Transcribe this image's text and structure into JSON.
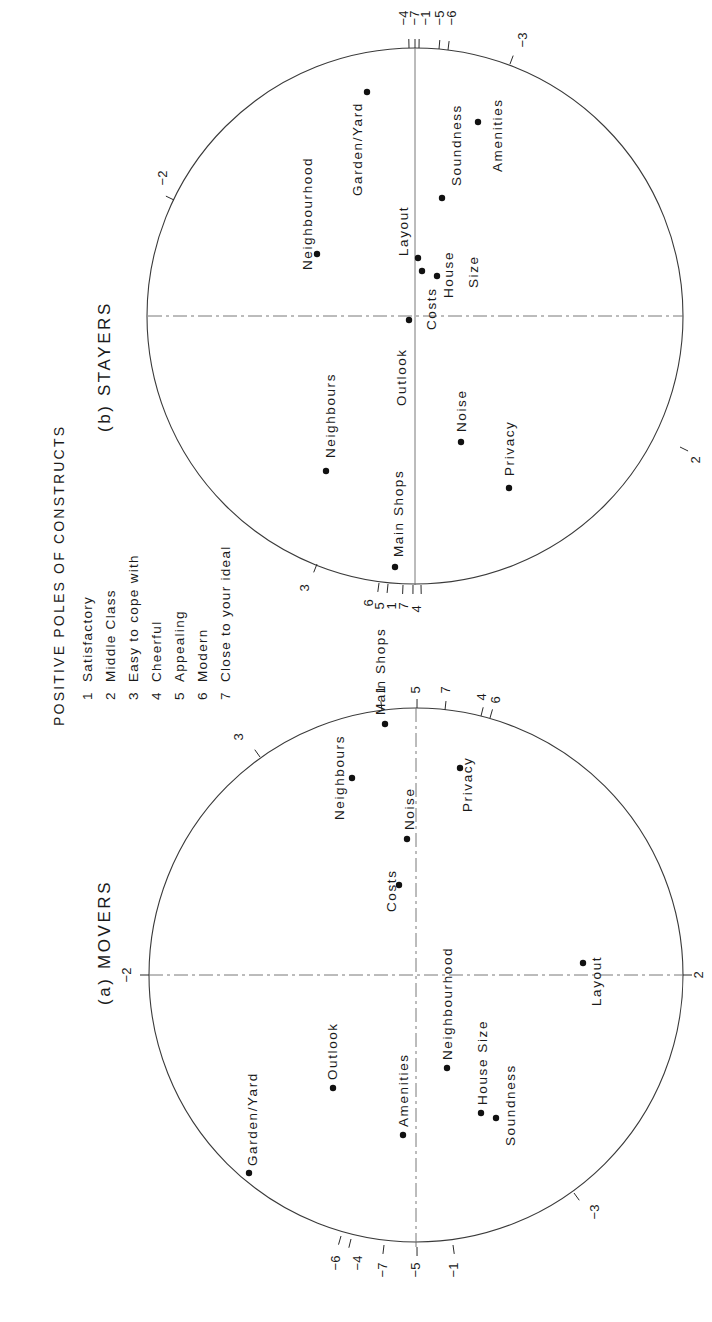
{
  "figure": {
    "legend": {
      "title": "POSITIVE POLES OF CONSTRUCTS",
      "items": [
        {
          "num": "1",
          "label": "Satisfactory"
        },
        {
          "num": "2",
          "label": "Middle Class"
        },
        {
          "num": "3",
          "label": "Easy to cope with"
        },
        {
          "num": "4",
          "label": "Cheerful"
        },
        {
          "num": "5",
          "label": "Appealing"
        },
        {
          "num": "6",
          "label": "Modern"
        },
        {
          "num": "7",
          "label": "Close to your ideal"
        }
      ]
    },
    "panels": [
      {
        "id": "movers",
        "title": "(a) MOVERS",
        "center": [
          416,
          975
        ],
        "radius": 267,
        "ticks": [
          {
            "label": "-2",
            "x": 149,
            "y": 975,
            "tx": 128,
            "ty": 975
          },
          {
            "label": "2",
            "x": 683,
            "y": 975,
            "tx": 700,
            "ty": 975
          },
          {
            "label": "3",
            "x": 260,
            "y": 757,
            "tx": 240,
            "ty": 737
          },
          {
            "label": "-3",
            "x": 574,
            "y": 1193,
            "tx": 596,
            "ty": 1212
          },
          {
            "label": "1",
            "x": 382,
            "y": 710,
            "tx": 382,
            "ty": 690
          },
          {
            "label": "5",
            "x": 417,
            "y": 708,
            "tx": 417,
            "ty": 690
          },
          {
            "label": "7",
            "x": 445,
            "y": 710,
            "tx": 447,
            "ty": 690
          },
          {
            "label": "4",
            "x": 481,
            "y": 716,
            "tx": 483,
            "ty": 697
          },
          {
            "label": "6",
            "x": 490,
            "y": 718,
            "tx": 497,
            "ty": 700
          },
          {
            "label": "-6",
            "x": 341,
            "y": 1236,
            "tx": 337,
            "ty": 1263
          },
          {
            "label": "-4",
            "x": 351,
            "y": 1239,
            "tx": 359,
            "ty": 1263
          },
          {
            "label": "-7",
            "x": 384,
            "y": 1245,
            "tx": 384,
            "ty": 1270
          },
          {
            "label": "-5",
            "x": 417,
            "y": 1247,
            "tx": 417,
            "ty": 1270
          },
          {
            "label": "-1",
            "x": 453,
            "y": 1245,
            "tx": 455,
            "ty": 1270
          }
        ],
        "points": [
          {
            "name": "Main Shops",
            "dot": [
              385,
              724
            ],
            "lx": 381,
            "ly": 715,
            "text": "Main Shops"
          },
          {
            "name": "Neighbours",
            "dot": [
              352,
              778
            ],
            "lx": 340,
            "ly": 820,
            "text": "Neighbours"
          },
          {
            "name": "Noise",
            "dot": [
              407,
              839
            ],
            "lx": 410,
            "ly": 830,
            "text": "Noise"
          },
          {
            "name": "Costs",
            "dot": [
              399,
              885
            ],
            "lx": 392,
            "ly": 912,
            "text": "Costs"
          },
          {
            "name": "Privacy",
            "dot": [
              460,
              768
            ],
            "lx": 468,
            "ly": 812,
            "text": "Privacy"
          },
          {
            "name": "Garden/Yard",
            "dot": [
              249,
              1173
            ],
            "lx": 253,
            "ly": 1166,
            "text": "Garden/Yard"
          },
          {
            "name": "Outlook",
            "dot": [
              333,
              1088
            ],
            "lx": 333,
            "ly": 1080,
            "text": "Outlook"
          },
          {
            "name": "Amenities",
            "dot": [
              403,
              1135
            ],
            "lx": 404,
            "ly": 1127,
            "text": "Amenities"
          },
          {
            "name": "Neighbourhood",
            "dot": [
              447,
              1068
            ],
            "lx": 448,
            "ly": 1060,
            "text": "Neighbourhood"
          },
          {
            "name": "House Size",
            "dot": [
              481,
              1113
            ],
            "lx": 483,
            "ly": 1105,
            "text": "House Size"
          },
          {
            "name": "Soundness",
            "dot": [
              496,
              1118
            ],
            "lx": 511,
            "ly": 1146,
            "text": "Soundness"
          },
          {
            "name": "Layout",
            "dot": [
              583,
              963
            ],
            "lx": 597,
            "ly": 1006,
            "text": "Layout"
          }
        ]
      },
      {
        "id": "stayers",
        "title": "(b) STAYERS",
        "center": [
          415,
          316
        ],
        "radius": 268,
        "ticks": [
          {
            "label": "-2",
            "x": 174,
            "y": 200,
            "tx": 164,
            "ty": 178
          },
          {
            "label": "2",
            "x": 680,
            "y": 447,
            "tx": 697,
            "ty": 460
          },
          {
            "label": "3",
            "x": 317,
            "y": 564,
            "tx": 306,
            "ty": 588
          },
          {
            "label": "-3",
            "x": 510,
            "y": 64,
            "tx": 524,
            "ty": 40
          },
          {
            "label": "-4",
            "x": 409,
            "y": 48,
            "tx": 405,
            "ty": 18
          },
          {
            "label": "-7",
            "x": 415,
            "y": 48,
            "tx": 416,
            "ty": 18
          },
          {
            "label": "-1",
            "x": 419,
            "y": 48,
            "tx": 427,
            "ty": 18
          },
          {
            "label": "-5",
            "x": 439,
            "y": 49,
            "tx": 441,
            "ty": 18
          },
          {
            "label": "-6",
            "x": 448,
            "y": 50,
            "tx": 453,
            "ty": 18
          },
          {
            "label": "6",
            "x": 379,
            "y": 583,
            "tx": 370,
            "ty": 603
          },
          {
            "label": "5",
            "x": 388,
            "y": 584,
            "tx": 381,
            "ty": 606
          },
          {
            "label": "1",
            "x": 403,
            "y": 585,
            "tx": 393,
            "ty": 606
          },
          {
            "label": "7",
            "x": 413,
            "y": 585,
            "tx": 405,
            "ty": 606
          },
          {
            "label": "4",
            "x": 421,
            "y": 585,
            "tx": 418,
            "ty": 609
          }
        ],
        "points": [
          {
            "name": "Neighbourhood",
            "dot": [
              317,
              254
            ],
            "lx": 308,
            "ly": 270,
            "text": "Neighbourhood"
          },
          {
            "name": "Garden/Yard",
            "dot": [
              367,
              92
            ],
            "lx": 358,
            "ly": 196,
            "text": "Garden/Yard"
          },
          {
            "name": "Layout",
            "dot": [
              418,
              258
            ],
            "lx": 404,
            "ly": 256,
            "text": "Layout"
          },
          {
            "name": "Costs",
            "dot": [
              422,
              271
            ],
            "lx": 432,
            "ly": 330,
            "text": "Costs"
          },
          {
            "name": "House Size",
            "dot": [
              437,
              276
            ],
            "lx": 449,
            "ly": 298,
            "text": "House"
          },
          {
            "name": "House Size (2)",
            "dot": null,
            "lx": 474,
            "ly": 288,
            "text": "Size"
          },
          {
            "name": "Soundness",
            "dot": [
              442,
              198
            ],
            "lx": 457,
            "ly": 186,
            "text": "Soundness"
          },
          {
            "name": "Amenities",
            "dot": [
              478,
              122
            ],
            "lx": 498,
            "ly": 172,
            "text": "Amenities"
          },
          {
            "name": "Outlook",
            "dot": [
              409,
              320
            ],
            "lx": 402,
            "ly": 406,
            "text": "Outlook"
          },
          {
            "name": "Neighbours",
            "dot": [
              326,
              471
            ],
            "lx": 331,
            "ly": 458,
            "text": "Neighbours"
          },
          {
            "name": "Main Shops",
            "dot": [
              395,
              567
            ],
            "lx": 399,
            "ly": 557,
            "text": "Main Shops"
          },
          {
            "name": "Noise",
            "dot": [
              461,
              442
            ],
            "lx": 462,
            "ly": 432,
            "text": "Noise"
          },
          {
            "name": "Privacy",
            "dot": [
              509,
              488
            ],
            "lx": 510,
            "ly": 476,
            "text": "Privacy"
          }
        ]
      }
    ]
  },
  "chart_data": [
    {
      "type": "scatter",
      "title": "(a) MOVERS",
      "xlabel": "Dimension 1 (vertical axis of rotated page; constructs 2 and 3 direction)",
      "ylabel": "Dimension 2",
      "xlim": [
        -1,
        1
      ],
      "ylim": [
        -1,
        1
      ],
      "grid": false,
      "shape": "unit circle with construct vectors marked on circumference",
      "construct_ticks": [
        "-2",
        "2",
        "3",
        "-3",
        "1",
        "5",
        "7",
        "4",
        "6",
        "-6",
        "-4",
        "-7",
        "-5",
        "-1"
      ],
      "points": [
        {
          "label": "Main Shops",
          "x": 0.94,
          "y": -0.12
        },
        {
          "label": "Neighbours",
          "x": 0.74,
          "y": -0.24
        },
        {
          "label": "Noise",
          "x": 0.51,
          "y": -0.03
        },
        {
          "label": "Costs",
          "x": 0.34,
          "y": -0.06
        },
        {
          "label": "Privacy",
          "x": 0.77,
          "y": 0.16
        },
        {
          "label": "Garden/Yard",
          "x": -0.74,
          "y": -0.63
        },
        {
          "label": "Outlook",
          "x": -0.42,
          "y": -0.31
        },
        {
          "label": "Amenities",
          "x": -0.6,
          "y": -0.05
        },
        {
          "label": "Neighbourhood",
          "x": -0.35,
          "y": 0.12
        },
        {
          "label": "House Size",
          "x": -0.52,
          "y": 0.24
        },
        {
          "label": "Soundness",
          "x": -0.54,
          "y": 0.3
        },
        {
          "label": "Layout",
          "x": 0.04,
          "y": 0.63
        }
      ]
    },
    {
      "type": "scatter",
      "title": "(b) STAYERS",
      "xlabel": "Dimension 1",
      "ylabel": "Dimension 2",
      "xlim": [
        -1,
        1
      ],
      "ylim": [
        -1,
        1
      ],
      "grid": false,
      "shape": "unit circle with construct vectors marked on circumference",
      "construct_ticks": [
        "-2",
        "2",
        "3",
        "-3",
        "-4",
        "-7",
        "-1",
        "-5",
        "-6",
        "6",
        "5",
        "1",
        "7",
        "4"
      ],
      "points": [
        {
          "label": "Neighbourhood",
          "x": 0.23,
          "y": -0.37
        },
        {
          "label": "Garden/Yard",
          "x": 0.84,
          "y": -0.18
        },
        {
          "label": "Layout",
          "x": 0.22,
          "y": 0.01
        },
        {
          "label": "Costs",
          "x": 0.17,
          "y": 0.03
        },
        {
          "label": "House Size",
          "x": 0.15,
          "y": 0.08
        },
        {
          "label": "Soundness",
          "x": 0.44,
          "y": 0.1
        },
        {
          "label": "Amenities",
          "x": 0.72,
          "y": 0.24
        },
        {
          "label": "Outlook",
          "x": -0.01,
          "y": -0.02
        },
        {
          "label": "Neighbours",
          "x": -0.58,
          "y": -0.33
        },
        {
          "label": "Main Shops",
          "x": -0.94,
          "y": -0.07
        },
        {
          "label": "Noise",
          "x": -0.47,
          "y": 0.17
        },
        {
          "label": "Privacy",
          "x": -0.64,
          "y": 0.35
        }
      ]
    }
  ]
}
